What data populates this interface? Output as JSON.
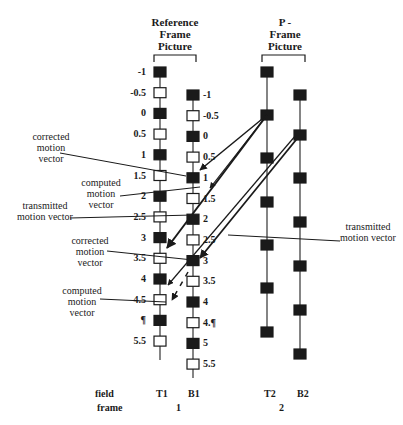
{
  "headers": {
    "reference": [
      "Reference",
      "Frame",
      "Picture"
    ],
    "pframe": [
      "P -",
      "Frame",
      "Picture"
    ]
  },
  "columns": {
    "T1": {
      "x": 160,
      "labels": [
        "-1",
        "-0.5",
        "0",
        "0.5",
        "1",
        "1.5",
        "2",
        "2.5",
        "3",
        "3.5",
        "4",
        "4.5",
        "¶",
        "5.5"
      ],
      "filled": [
        true,
        false,
        true,
        false,
        true,
        false,
        true,
        false,
        true,
        false,
        true,
        false,
        true,
        false
      ],
      "y_start": 72,
      "y_step": 20.7
    },
    "B1": {
      "x": 193,
      "labels": [
        "-1",
        "-0.5",
        "0",
        "0.5",
        "1",
        "1.5",
        "2",
        "2.5",
        "3",
        "3.5",
        "4",
        "4.¶",
        "5",
        "5.5"
      ],
      "filled": [
        true,
        false,
        true,
        false,
        true,
        false,
        true,
        false,
        true,
        false,
        true,
        false,
        true,
        false
      ],
      "y_start": 95,
      "y_step": 20.7
    },
    "T2": {
      "x": 267,
      "ys": [
        72,
        115,
        158,
        202,
        245,
        288,
        332
      ]
    },
    "B2": {
      "x": 300,
      "ys": [
        95,
        135,
        178,
        222,
        266,
        310,
        354
      ]
    }
  },
  "annotations": {
    "corrected_1": [
      "corrected",
      "motion",
      "vector"
    ],
    "computed_1": [
      "computed",
      "motion",
      "vector"
    ],
    "transmitted_1": [
      "transmitted",
      "motion vector"
    ],
    "transmitted_2": [
      "transmitted",
      "motion vector"
    ],
    "corrected_2": [
      "corrected",
      "motion",
      "vector"
    ],
    "computed_2": [
      "computed",
      "motion",
      "vector"
    ]
  },
  "axis": {
    "field_label": "field",
    "frame_label": "frame",
    "fields": [
      "T1",
      "B1",
      "T2",
      "B2"
    ],
    "frames": [
      "1",
      "2"
    ]
  }
}
